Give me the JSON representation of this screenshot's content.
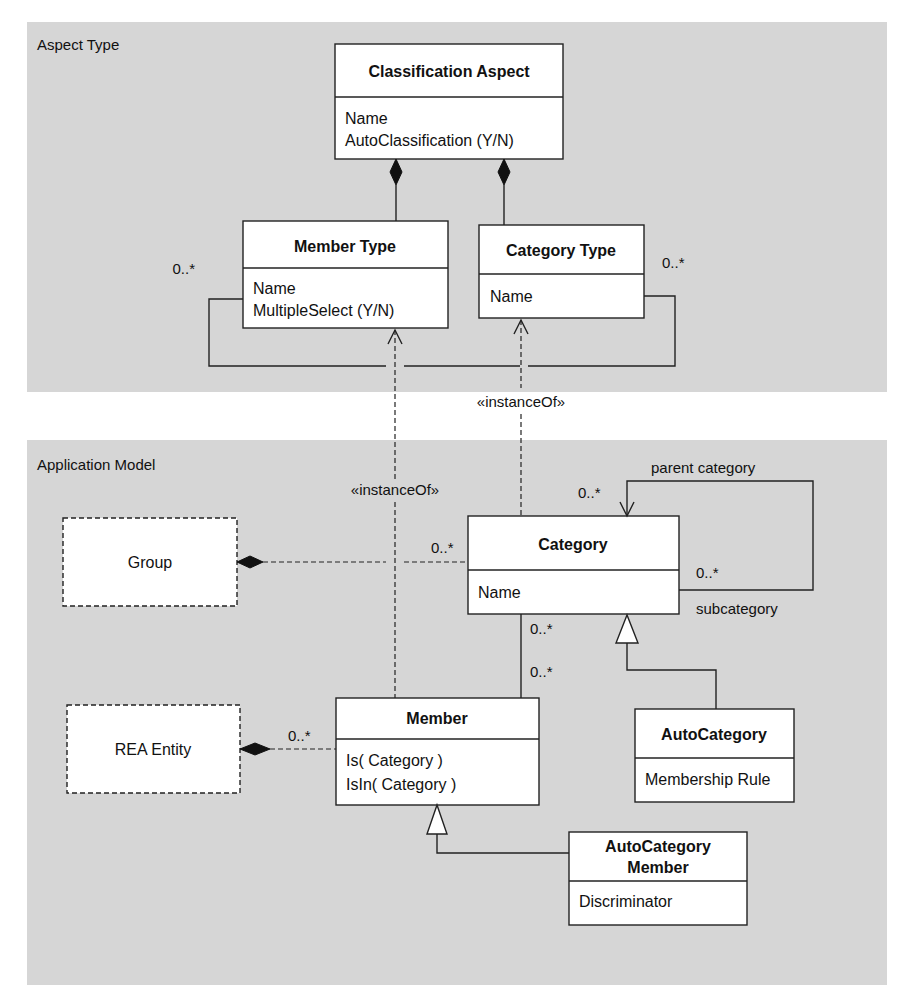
{
  "panels": {
    "aspect_type": {
      "title": "Aspect Type",
      "color": "#d6d6d6"
    },
    "application_model": {
      "title": "Application Model",
      "color": "#d6d6d6"
    }
  },
  "classes": {
    "classification_aspect": {
      "name": "Classification Aspect",
      "attributes": [
        "Name",
        "AutoClassification (Y/N)"
      ]
    },
    "member_type": {
      "name": "Member Type",
      "attributes": [
        "Name",
        "MultipleSelect (Y/N)"
      ]
    },
    "category_type": {
      "name": "Category Type",
      "attributes": [
        "Name"
      ]
    },
    "group": {
      "name": "Group"
    },
    "category": {
      "name": "Category",
      "attributes": [
        "Name"
      ]
    },
    "rea_entity": {
      "name": "REA Entity"
    },
    "member": {
      "name": "Member",
      "attributes": [
        "Is( Category )",
        "IsIn( Category )"
      ]
    },
    "auto_category": {
      "name": "AutoCategory",
      "attributes": [
        "Membership Rule"
      ]
    },
    "auto_category_member": {
      "name_lines": [
        "AutoCategory",
        "Member"
      ],
      "attributes": [
        "Discriminator"
      ]
    }
  },
  "labels": {
    "instance_of_upper": "«instanceOf»",
    "instance_of_lower": "«instanceOf»",
    "member_type_mult": "0..*",
    "category_type_mult": "0..*",
    "parent_category": "parent category",
    "subcategory": "subcategory",
    "parent_mult": "0..*",
    "sub_mult": "0..*",
    "group_category_mult": "0..*",
    "category_member_mult_top": "0..*",
    "category_member_mult_bottom": "0..*",
    "rea_member_mult": "0..*"
  }
}
